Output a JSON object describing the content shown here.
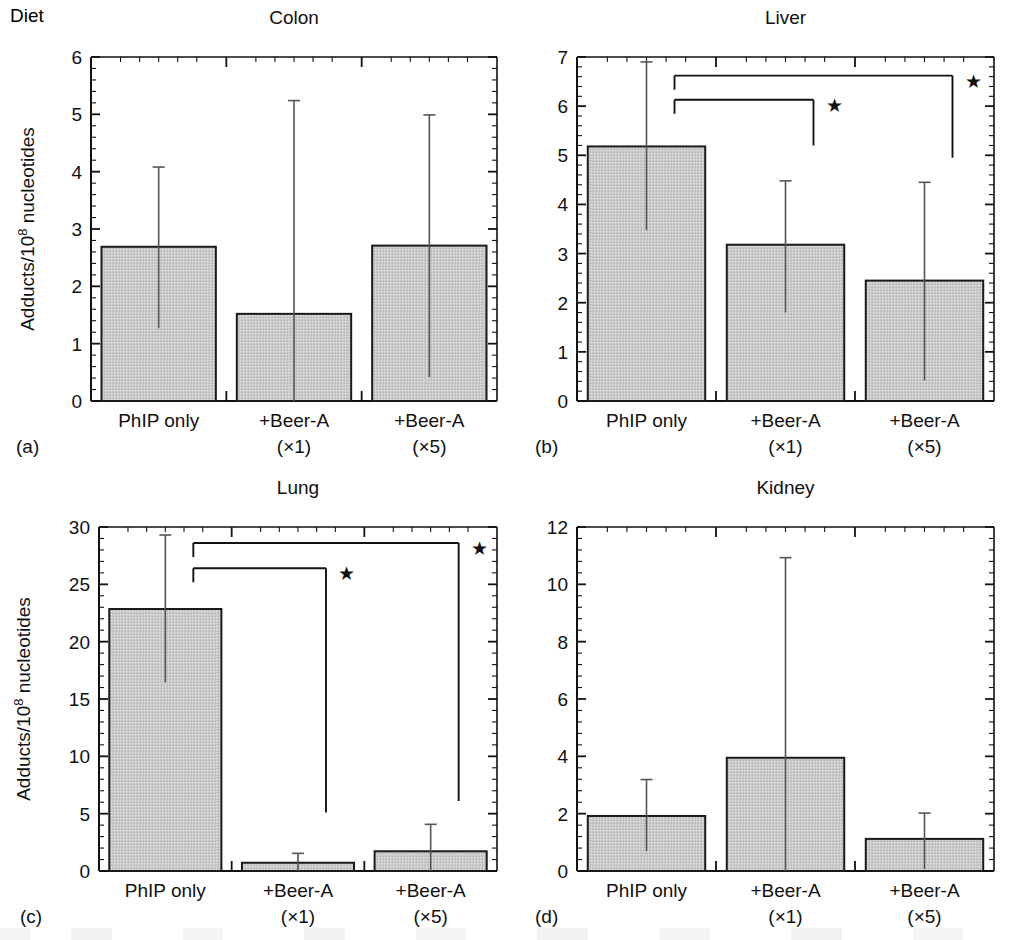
{
  "figure": {
    "diet_label": "Diet",
    "y_axis_label": "Adducts/10⁸ nucleotides",
    "y_axis_label_main": "Adducts/10",
    "y_axis_label_sup": "8",
    "y_axis_label_tail": " nucleotides",
    "significance_marker": "★",
    "bar_fill": "#c9c9c9",
    "bar_stroke": "#1a1a1a",
    "axis_color": "#111111",
    "background": "#ffffff"
  },
  "chart_data": [
    {
      "panel": "(a)",
      "type": "bar",
      "title": "Colon",
      "categories": [
        "PhIP only",
        "+Beer-A",
        "+Beer-A"
      ],
      "category_sub": [
        "",
        "(×1)",
        "(×5)"
      ],
      "values": [
        2.69,
        1.52,
        2.71
      ],
      "err_upper": [
        1.39,
        3.72,
        2.28
      ],
      "err_lower": [
        1.42,
        1.52,
        2.29
      ],
      "ylabel": "Adducts/10⁸ nucleotides",
      "show_ylabel": false,
      "xlabel": "",
      "ylim": [
        0,
        6
      ],
      "yticks": [
        0,
        1,
        2,
        3,
        4,
        5,
        6
      ],
      "ytick_labels": [
        "0",
        "1",
        "2",
        "3",
        "4",
        "5",
        "6"
      ],
      "minor_tick_step": 0.2,
      "grid": false,
      "brackets": []
    },
    {
      "panel": "(b)",
      "type": "bar",
      "title": "Liver",
      "categories": [
        "PhIP only",
        "+Beer-A",
        "+Beer-A"
      ],
      "category_sub": [
        "",
        "(×1)",
        "(×5)"
      ],
      "values": [
        5.18,
        3.18,
        2.45
      ],
      "err_upper": [
        1.72,
        1.3,
        2.0
      ],
      "err_lower": [
        1.7,
        1.38,
        2.03
      ],
      "ylabel": "Adducts/10⁸ nucleotides",
      "show_ylabel": false,
      "xlabel": "",
      "ylim": [
        0,
        7
      ],
      "yticks": [
        0,
        1,
        2,
        3,
        4,
        5,
        6,
        7
      ],
      "ytick_labels": [
        "0",
        "1",
        "2",
        "3",
        "4",
        "5",
        "6",
        "7"
      ],
      "minor_tick_step": 0.2,
      "grid": false,
      "brackets": [
        {
          "from_group": 0,
          "to_group": 2,
          "y": 6.62,
          "drop_to": 4.95,
          "star": "★",
          "label": "PhIP only vs +Beer-A (×5)"
        },
        {
          "from_group": 0,
          "to_group": 1,
          "y": 6.13,
          "drop_to": 5.2,
          "star": "★",
          "label": "PhIP only vs +Beer-A (×1)"
        }
      ]
    },
    {
      "panel": "(c)",
      "type": "bar",
      "title": "Lung",
      "categories": [
        "PhIP only",
        "+Beer-A",
        "+Beer-A"
      ],
      "category_sub": [
        "",
        "(×1)",
        "(×5)"
      ],
      "values": [
        22.85,
        0.72,
        1.72
      ],
      "err_upper": [
        6.45,
        0.82,
        2.35
      ],
      "err_lower": [
        6.4,
        0.72,
        1.72
      ],
      "ylabel": "Adducts/10⁸ nucleotides",
      "show_ylabel": true,
      "xlabel": "",
      "ylim": [
        0,
        30
      ],
      "yticks": [
        0,
        5,
        10,
        15,
        20,
        25,
        30
      ],
      "ytick_labels": [
        "0",
        "5",
        "10",
        "15",
        "20",
        "25",
        "30"
      ],
      "minor_tick_step": 1,
      "grid": false,
      "brackets": [
        {
          "from_group": 0,
          "to_group": 2,
          "y": 28.6,
          "drop_to": 6.1,
          "star": "★",
          "label": "PhIP only vs +Beer-A (×5)"
        },
        {
          "from_group": 0,
          "to_group": 1,
          "y": 26.4,
          "drop_to": 5.1,
          "star": "★",
          "label": "PhIP only vs +Beer-A (×1)"
        }
      ]
    },
    {
      "panel": "(d)",
      "type": "bar",
      "title": "Kidney",
      "categories": [
        "PhIP only",
        "+Beer-A",
        "+Beer-A"
      ],
      "category_sub": [
        "",
        "(×1)",
        "(×5)"
      ],
      "values": [
        1.92,
        3.95,
        1.12
      ],
      "err_upper": [
        1.27,
        6.98,
        0.9
      ],
      "err_lower": [
        1.22,
        3.95,
        1.05
      ],
      "ylabel": "Adducts/10⁸ nucleotides",
      "show_ylabel": false,
      "xlabel": "",
      "ylim": [
        0,
        12
      ],
      "yticks": [
        0,
        2,
        4,
        6,
        8,
        10,
        12
      ],
      "ytick_labels": [
        "0",
        "2",
        "4",
        "6",
        "8",
        "10",
        "12"
      ],
      "minor_tick_step": 0.4,
      "grid": false,
      "brackets": []
    }
  ]
}
